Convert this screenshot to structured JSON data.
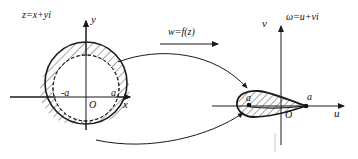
{
  "figure": {
    "ink_color": "#1a1a1a",
    "hatch_color": "#333333"
  },
  "z_plane": {
    "plane_label": "z=x+yi",
    "axis_x_label": "x",
    "axis_y_label": "y",
    "origin_label": "O",
    "point_neg_a_label": "-a",
    "point_a_label": "a",
    "outer_circle": {
      "cx": 86,
      "cy": 83,
      "r": 41,
      "style": "solid",
      "hatched": true
    },
    "inner_circle": {
      "cx": 86,
      "cy": 88,
      "r": 33,
      "style": "dashed",
      "hatched": false
    },
    "axis_x": {
      "x1": 10,
      "y1": 97,
      "x2": 134,
      "y2": 97
    },
    "axis_y": {
      "x1": 86,
      "y1": 130,
      "x2": 86,
      "y2": 17
    }
  },
  "mapping": {
    "operator_label": "w=f(z)",
    "arrow_direction": "right",
    "arrow": {
      "x1": 160,
      "y1": 43,
      "x2": 222,
      "y2": 43
    }
  },
  "w_plane": {
    "plane_label": "ω=u+vi",
    "axis_u_label": "u",
    "axis_v_label": "v",
    "origin_label": "O",
    "point_neg_a_label": "a",
    "point_a_label": "a",
    "airfoil": {
      "hatched": true,
      "leading_edge": {
        "x": 245,
        "y": 106
      },
      "trailing_edge": {
        "x": 306,
        "y": 106
      }
    },
    "axis_u": {
      "x1": 212,
      "y1": 106,
      "x2": 348,
      "y2": 106
    },
    "axis_v": {
      "x1": 281,
      "y1": 145,
      "x2": 281,
      "y2": 22
    }
  },
  "connectors": [
    {
      "name": "upper-mapping-arrow",
      "from": "circle-top-right",
      "to": "airfoil-top"
    },
    {
      "name": "lower-mapping-arrow",
      "from": "circle-bottom",
      "to": "airfoil-bottom-left"
    }
  ]
}
